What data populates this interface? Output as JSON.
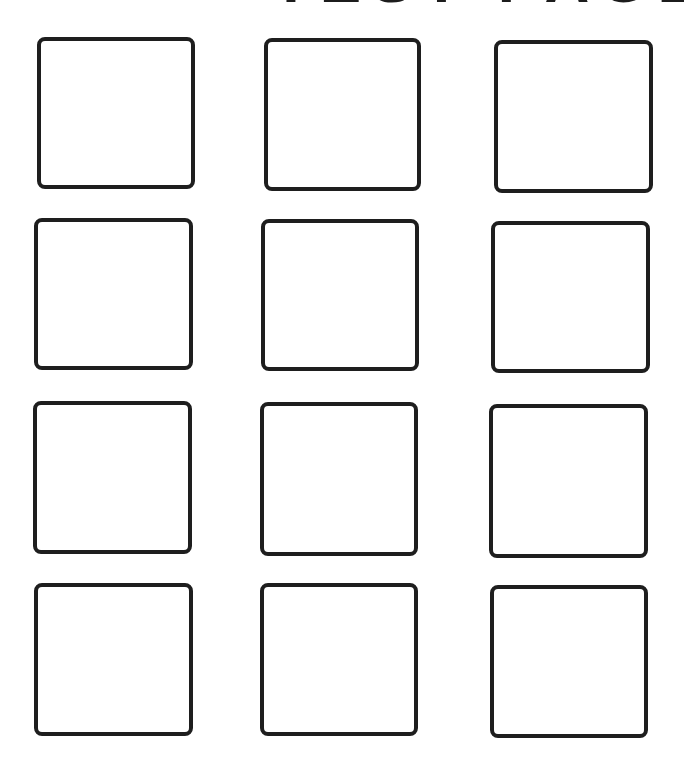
{
  "heading": {
    "text": "TEST PAGE",
    "color": "#1c1c1c"
  },
  "grid": {
    "rows": 4,
    "columns": 3,
    "border_color": "#1e1e1e",
    "boxes": [
      {
        "row": 1,
        "col": 1,
        "x": 37,
        "y": 37,
        "w": 158,
        "h": 152
      },
      {
        "row": 1,
        "col": 2,
        "x": 264,
        "y": 38,
        "w": 157,
        "h": 153
      },
      {
        "row": 1,
        "col": 3,
        "x": 494,
        "y": 40,
        "w": 159,
        "h": 153
      },
      {
        "row": 2,
        "col": 1,
        "x": 34,
        "y": 218,
        "w": 159,
        "h": 152
      },
      {
        "row": 2,
        "col": 2,
        "x": 261,
        "y": 219,
        "w": 158,
        "h": 152
      },
      {
        "row": 2,
        "col": 3,
        "x": 491,
        "y": 221,
        "w": 159,
        "h": 152
      },
      {
        "row": 3,
        "col": 1,
        "x": 33,
        "y": 401,
        "w": 159,
        "h": 153
      },
      {
        "row": 3,
        "col": 2,
        "x": 260,
        "y": 402,
        "w": 158,
        "h": 154
      },
      {
        "row": 3,
        "col": 3,
        "x": 489,
        "y": 404,
        "w": 159,
        "h": 154
      },
      {
        "row": 4,
        "col": 1,
        "x": 34,
        "y": 583,
        "w": 159,
        "h": 153
      },
      {
        "row": 4,
        "col": 2,
        "x": 260,
        "y": 583,
        "w": 158,
        "h": 153
      },
      {
        "row": 4,
        "col": 3,
        "x": 490,
        "y": 585,
        "w": 158,
        "h": 153
      }
    ]
  }
}
